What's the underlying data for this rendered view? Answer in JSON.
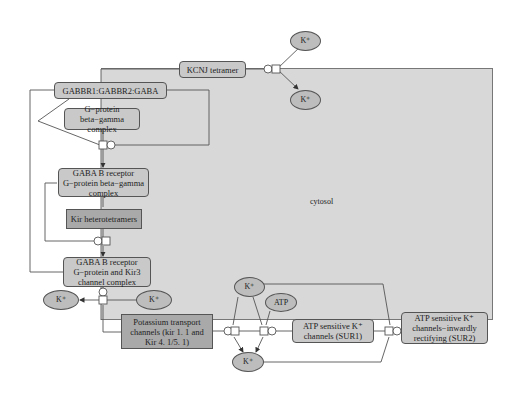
{
  "diagram": {
    "type": "reaction-pathway",
    "compartment": {
      "label": "cytosol",
      "fill": "#d8d8d8"
    },
    "colors": {
      "complex_fill": "#c9c9c9",
      "protein_fill": "#a9a9a9",
      "entity_fill": "#bdbdbd",
      "edge": "#555555",
      "background": "#ffffff"
    },
    "nodes": {
      "kcnj": "KCNJ tetramer",
      "k_top_out": "K⁺",
      "k_top_in": "K⁺",
      "gabbr": "GABBR1:GABBR2:GABA",
      "gprot": "G−protein beta−gamma complex",
      "gabab_gprot": "GABA B receptor G−protein beta−gamma complex",
      "kir_hetero": "Kir heterotetramers",
      "gabab_kir3": "GABA B receptor G−protein and Kir3 channel complex",
      "k_left_out": "K⁺",
      "k_left_in": "K⁺",
      "pot_transport": "Potassium transport channels (kir 1. 1 and Kir 4. 1/5. 1)",
      "k_bottom_in": "K⁺",
      "atp": "ATP",
      "k_bottom_out": "K⁺",
      "atp_sur1": "ATP sensitive K⁺ channels (SUR1)",
      "atp_sur2": "ATP sensitive K⁺ channels−inwardly rectifying (SUR2)"
    }
  }
}
